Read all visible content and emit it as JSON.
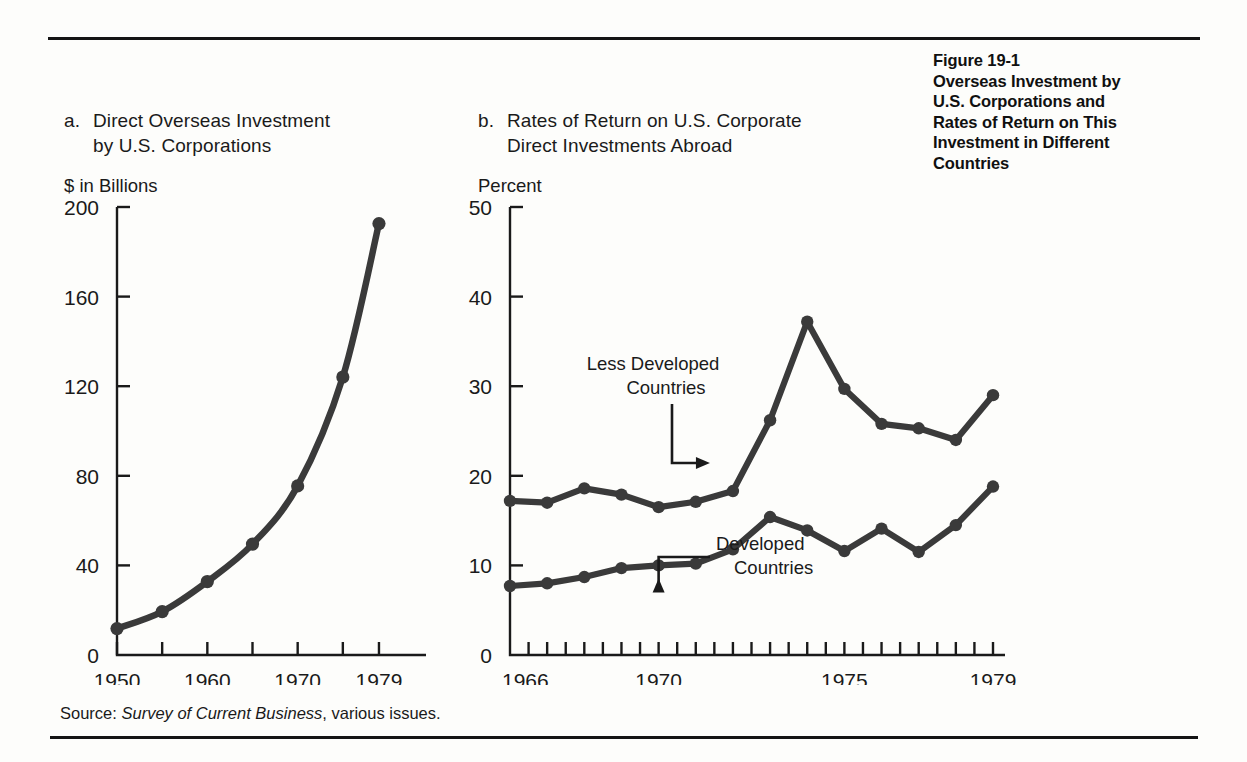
{
  "figure": {
    "caption_lines": [
      "Figure 19-1",
      "Overseas Investment by",
      "U.S. Corporations and",
      "Rates of Return on This",
      "Investment in Different",
      "Countries"
    ]
  },
  "source": {
    "prefix": "Source:",
    "italic": "Survey of Current Business",
    "suffix": ", various issues."
  },
  "panel_a": {
    "marker": "a.",
    "title_line1": "Direct Overseas Investment",
    "title_line2": "by U.S. Corporations",
    "unit_label": "$ in Billions"
  },
  "panel_b": {
    "marker": "b.",
    "title_line1": "Rates of Return on U.S. Corporate",
    "title_line2": "Direct Investments Abroad",
    "unit_label": "Percent"
  },
  "colors": {
    "ink": "#1a1a1a",
    "line": "#3a3a3a",
    "rule": "#141414",
    "background": "#fdfdfb"
  },
  "chart_data": [
    {
      "id": "panel-a",
      "type": "line",
      "title": "a. Direct Overseas Investment by U.S. Corporations",
      "xlabel": "",
      "ylabel": "$ in Billions",
      "ylim": [
        0,
        200
      ],
      "xlim": [
        1950,
        1980
      ],
      "yticks": [
        0,
        40,
        80,
        120,
        160,
        200
      ],
      "ytick_labels": [
        "0",
        "40",
        "80",
        "120",
        "160",
        "200"
      ],
      "xticks": [
        1950,
        1955,
        1960,
        1965,
        1970,
        1975,
        1979
      ],
      "xtick_labels_shown": [
        "1950",
        "1960",
        "1970",
        "1979"
      ],
      "xtick_labels_values": [
        1950,
        1960,
        1970,
        1979
      ],
      "grid": false,
      "legend": "none",
      "markers": true,
      "x": [
        1950,
        1955,
        1960,
        1965,
        1970,
        1975,
        1979
      ],
      "values": [
        11.8,
        19.4,
        32.8,
        49.5,
        75.5,
        124.1,
        192.6
      ]
    },
    {
      "id": "panel-b",
      "type": "line",
      "title": "b. Rates of Return on U.S. Corporate Direct Investments Abroad",
      "xlabel": "",
      "ylabel": "Percent",
      "ylim": [
        0,
        50
      ],
      "xlim": [
        1966,
        1979
      ],
      "yticks": [
        0,
        10,
        20,
        30,
        40,
        50
      ],
      "ytick_labels": [
        "0",
        "10",
        "20",
        "30",
        "40",
        "50"
      ],
      "xticks": [
        1966,
        1967,
        1968,
        1969,
        1970,
        1971,
        1972,
        1973,
        1974,
        1975,
        1976,
        1977,
        1978,
        1979
      ],
      "xtick_labels_shown": [
        "1966",
        "1970",
        "1975",
        "1979"
      ],
      "xtick_labels_values": [
        1966,
        1970,
        1975,
        1979
      ],
      "grid": false,
      "legend": "annotations",
      "markers": true,
      "x": [
        1966,
        1967,
        1968,
        1969,
        1970,
        1971,
        1972,
        1973,
        1974,
        1975,
        1976,
        1977,
        1978,
        1979
      ],
      "series": [
        {
          "name": "Less Developed Countries",
          "values": [
            17.2,
            17.0,
            18.6,
            17.9,
            16.5,
            17.1,
            18.3,
            26.2,
            37.2,
            29.7,
            25.8,
            25.3,
            24.0,
            29.0
          ],
          "annotation": {
            "text_line1": "Less Developed",
            "text_line2": "Countries",
            "points_to_year": 1972,
            "points_to_value": 18.3
          }
        },
        {
          "name": "Developed Countries",
          "values": [
            7.7,
            8.0,
            8.7,
            9.7,
            10.0,
            10.2,
            11.8,
            15.4,
            13.9,
            11.6,
            14.1,
            11.5,
            14.5,
            18.8
          ],
          "annotation": {
            "text_line1": "Developed",
            "text_line2": "Countries",
            "points_to_year": 1970,
            "points_to_value": 10.0
          }
        }
      ]
    }
  ]
}
